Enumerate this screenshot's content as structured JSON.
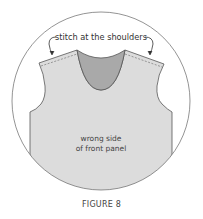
{
  "figure": {
    "callout_label": "stitch at the shoulders",
    "panel_label_line1": "wrong side",
    "panel_label_line2": "of front panel",
    "caption": "FIGURE 8"
  },
  "colors": {
    "panel_fill": "#dcdcdc",
    "neckline_fill": "#a9a9a9",
    "outline": "#555555"
  }
}
